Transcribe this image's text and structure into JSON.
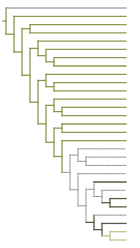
{
  "diagram": {
    "type": "phylogenetic-tree",
    "orientation": "left-to-right",
    "leaf_count": 27,
    "colors": {
      "green": "#8a9a4c",
      "grey": "#a8a8a8",
      "dark": "#5a5a4a",
      "dotted": "#8c8c8c",
      "light_green": "#b7c98a"
    },
    "tree": {
      "style": "green",
      "children": [
        {
          "leaf": true,
          "style": "grey"
        },
        {
          "style": "green",
          "children": [
            {
              "leaf": true,
              "style": "green"
            },
            {
              "style": "green",
              "children": [
                {
                  "style": "green",
                  "children": [
                    {
                      "leaf": true,
                      "style": "green"
                    },
                    {
                      "leaf": true,
                      "style": "green"
                    }
                  ]
                },
                {
                  "style": "green",
                  "children": [
                    {
                      "style": "green",
                      "children": [
                        {
                          "leaf": true,
                          "style": "green"
                        },
                        {
                          "style": "green",
                          "children": [
                            {
                              "leaf": true,
                              "style": "green"
                            },
                            {
                              "style": "green",
                              "children": [
                                {
                                  "leaf": true,
                                  "style": "green"
                                },
                                {
                                  "leaf": true,
                                  "style": "green"
                                }
                              ]
                            }
                          ]
                        }
                      ]
                    },
                    {
                      "style": "green",
                      "children": [
                        {
                          "style": "green",
                          "children": [
                            {
                              "leaf": true,
                              "style": "green"
                            },
                            {
                              "style": "green",
                              "children": [
                                {
                                  "leaf": true,
                                  "style": "green"
                                },
                                {
                                  "leaf": true,
                                  "style": "green"
                                }
                              ]
                            }
                          ]
                        },
                        {
                          "style": "green",
                          "children": [
                            {
                              "style": "green",
                              "children": [
                                {
                                  "leaf": true,
                                  "style": "green"
                                },
                                {
                                  "style": "green",
                                  "children": [
                                    {
                                      "leaf": true,
                                      "style": "green"
                                    },
                                    {
                                      "leaf": true,
                                      "style": "green"
                                    }
                                  ]
                                }
                              ]
                            },
                            {
                              "style": "green",
                              "children": [
                                {
                                  "style": "green",
                                  "children": [
                                    {
                                      "leaf": true,
                                      "style": "green"
                                    },
                                    {
                                      "leaf": true,
                                      "style": "green"
                                    }
                                  ]
                                },
                                {
                                  "style": "green",
                                  "children": [
                                    {
                                      "leaf": true,
                                      "style": "green"
                                    },
                                    {
                                      "style": "dotted",
                                      "children": [
                                        {
                                          "style": "dotted",
                                          "children": [
                                            {
                                              "leaf": true,
                                              "style": "dotted"
                                            },
                                            {
                                              "style": "dotted",
                                              "children": [
                                                {
                                                  "leaf": true,
                                                  "style": "dotted"
                                                },
                                                {
                                                  "leaf": true,
                                                  "style": "dotted"
                                                }
                                              ]
                                            }
                                          ]
                                        },
                                        {
                                          "style": "dotted",
                                          "children": [
                                            {
                                              "leaf": true,
                                              "style": "dotted"
                                            },
                                            {
                                              "style": "dotted",
                                              "children": [
                                                {
                                                  "style": "dotted",
                                                  "children": [
                                                    {
                                                      "leaf": true,
                                                      "style": "dark"
                                                    },
                                                    {
                                                      "style": "dotted",
                                                      "children": [
                                                        {
                                                          "leaf": true,
                                                          "style": "dotted"
                                                        },
                                                        {
                                                          "style": "dark",
                                                          "children": [
                                                            {
                                                              "leaf": true,
                                                              "style": "dark"
                                                            },
                                                            {
                                                              "leaf": true,
                                                              "style": "dark"
                                                            }
                                                          ]
                                                        }
                                                      ]
                                                    }
                                                  ]
                                                },
                                                {
                                                  "style": "dark",
                                                  "children": [
                                                    {
                                                      "leaf": true,
                                                      "style": "dotted"
                                                    },
                                                    {
                                                      "style": "dark",
                                                      "children": [
                                                        {
                                                          "leaf": true,
                                                          "style": "dark"
                                                        },
                                                        {
                                                          "style": "light_green",
                                                          "children": [
                                                            {
                                                              "leaf": true,
                                                              "style": "light_green"
                                                            },
                                                            {
                                                              "leaf": true,
                                                              "style": "light_green"
                                                            }
                                                          ]
                                                        }
                                                      ]
                                                    }
                                                  ]
                                                }
                                              ]
                                            }
                                          ]
                                        }
                                      ]
                                    }
                                  ]
                                }
                              ]
                            }
                          ]
                        }
                      ]
                    }
                  ]
                }
              ]
            }
          ]
        }
      ]
    }
  }
}
